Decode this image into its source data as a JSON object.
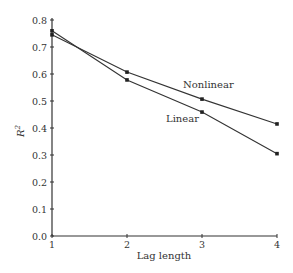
{
  "chart_data": {
    "type": "line",
    "title": "",
    "xlabel": "Lag length",
    "ylabel": "R²",
    "x": [
      1,
      2,
      3,
      4
    ],
    "xlim": [
      1,
      4
    ],
    "ylim": [
      0.0,
      0.8
    ],
    "xticks": [
      "1",
      "2",
      "3",
      "4"
    ],
    "yticks": [
      "0.0",
      "0.1",
      "0.2",
      "0.3",
      "0.4",
      "0.5",
      "0.6",
      "0.7",
      "0.8"
    ],
    "grid": false,
    "legend": "inline labels",
    "series": [
      {
        "name": "Nonlinear",
        "values": [
          0.745,
          0.607,
          0.507,
          0.415
        ]
      },
      {
        "name": "Linear",
        "values": [
          0.76,
          0.578,
          0.459,
          0.305
        ]
      }
    ]
  }
}
